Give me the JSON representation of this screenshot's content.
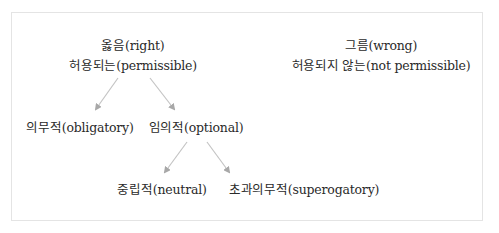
{
  "diagram": {
    "title": "",
    "nodes": {
      "right": {
        "line1": "옳음(right)",
        "line2": "허용되는(permissible)"
      },
      "wrong": {
        "line1": "그름(wrong)",
        "line2": "허용되지 않는(not permissible)"
      },
      "obligatory": {
        "label": "의무적(obligatory)"
      },
      "optional": {
        "label": "임의적(optional)"
      },
      "neutral": {
        "label": "중립적(neutral)"
      },
      "supererogatory": {
        "label": "초과의무적(superogatory)"
      }
    },
    "edges": [
      {
        "from": "right",
        "to": "obligatory"
      },
      {
        "from": "right",
        "to": "optional"
      },
      {
        "from": "optional",
        "to": "neutral"
      },
      {
        "from": "optional",
        "to": "supererogatory"
      }
    ],
    "colors": {
      "arrow": "#c4c4c4",
      "arrowhead": "#a8a8a8",
      "text": "#2a2a2a",
      "border": "#e4e4e4"
    }
  }
}
